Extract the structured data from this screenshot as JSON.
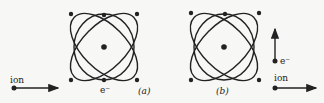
{
  "diagram": {
    "panel_a": {
      "label": "(a)",
      "ion_label": "ion",
      "electron_label": "e⁻",
      "ion_arrow_direction": "right",
      "center": [
        104,
        47
      ]
    },
    "panel_b": {
      "label": "(b)",
      "ion_label": "ion",
      "electron_label": "e⁻",
      "ion_arrow_direction": "right",
      "electron_arrow_direction": "up",
      "center": [
        224,
        47
      ]
    },
    "colors": {
      "ink": "#222222",
      "background": "#f7f7f5"
    }
  }
}
